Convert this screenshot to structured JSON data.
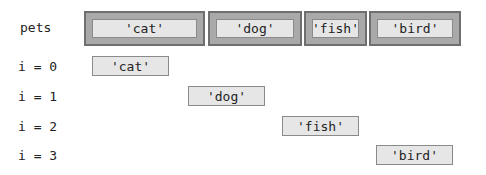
{
  "array": {
    "name": "pets",
    "elements": [
      "'cat'",
      "'dog'",
      "'fish'",
      "'bird'"
    ]
  },
  "iterations": [
    {
      "label": "i = 0",
      "value": "'cat'"
    },
    {
      "label": "i = 1",
      "value": "'dog'"
    },
    {
      "label": "i = 2",
      "value": "'fish'"
    },
    {
      "label": "i = 3",
      "value": "'bird'"
    }
  ]
}
